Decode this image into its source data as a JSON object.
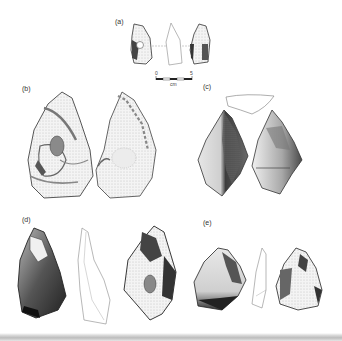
{
  "figure": {
    "panels": [
      {
        "id": "a",
        "label": "(a)",
        "description": "small flake tool, two faces and profile"
      },
      {
        "id": "b",
        "label": "(b)",
        "description": "large cortical core/tool, two faces"
      },
      {
        "id": "c",
        "label": "(c)",
        "description": "pointed tool, two faces and cross-section outline"
      },
      {
        "id": "d",
        "label": "(d)",
        "description": "elongated point, two faces and profile outline"
      },
      {
        "id": "e",
        "label": "(e)",
        "description": "small triangular flake, two faces and profile"
      }
    ],
    "scale_bar": {
      "min_label": "0",
      "max_label": "5",
      "unit_label": "cm"
    },
    "colors": {
      "ink": "#2a2a2a",
      "shade_dark": "#3a3a3a",
      "shade_mid": "#8a8a8a",
      "shade_light": "#d9d9d9",
      "outline": "#777777",
      "background": "#ffffff"
    }
  }
}
